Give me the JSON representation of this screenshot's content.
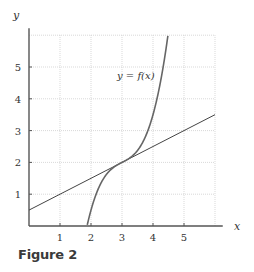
{
  "figure": {
    "caption": "Figure 2",
    "curve_label": "y = f(x)",
    "x_axis_label": "x",
    "y_axis_label": "y",
    "x_ticks": [
      "1",
      "2",
      "3",
      "4",
      "5"
    ],
    "y_ticks": [
      "1",
      "2",
      "3",
      "4",
      "5"
    ],
    "colors": {
      "axis": "#555555",
      "grid": "#c8c8c8",
      "curve": "#666666",
      "line": "#444444",
      "caption": "#3a3a3a"
    }
  },
  "chart_data": {
    "type": "line",
    "title": "",
    "caption": "Figure 2",
    "xlabel": "x",
    "ylabel": "y",
    "xlim": [
      0,
      6.2
    ],
    "ylim": [
      0,
      6
    ],
    "x_ticks": [
      1,
      2,
      3,
      4,
      5
    ],
    "y_ticks": [
      1,
      2,
      3,
      4,
      5
    ],
    "grid": true,
    "legend": null,
    "annotations": [
      {
        "text": "y = f(x)",
        "x": 3.9,
        "y": 4.7
      }
    ],
    "series": [
      {
        "name": "y = f(x)",
        "description": "Cubic-like increasing curve with inflection point at (3, 2), tangent to the line there",
        "x": [
          1.87,
          2.0,
          2.25,
          2.5,
          2.75,
          3.0,
          3.25,
          3.5,
          3.75,
          4.0,
          4.25,
          4.45
        ],
        "values": [
          0.0,
          0.41,
          1.2,
          1.63,
          1.86,
          2.0,
          2.14,
          2.38,
          2.8,
          3.5,
          4.58,
          6.0
        ]
      },
      {
        "name": "tangent line",
        "description": "Straight line y = 0.5x + 0.5, tangent to f at x = 3",
        "x": [
          0,
          1,
          2,
          3,
          4,
          5,
          6
        ],
        "values": [
          0.5,
          1.0,
          1.5,
          2.0,
          2.5,
          3.0,
          3.5
        ]
      }
    ]
  }
}
